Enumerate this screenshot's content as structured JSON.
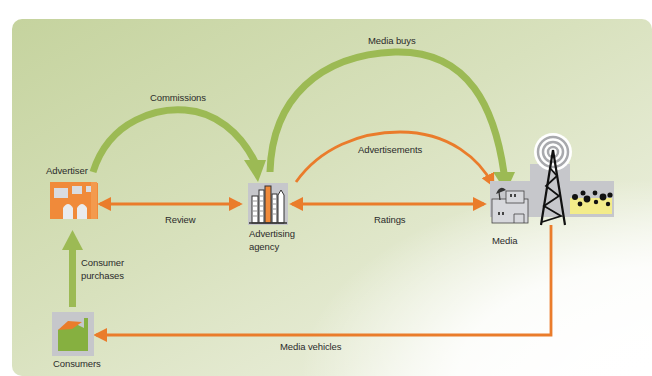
{
  "colors": {
    "panel_top": "#c9d6a4",
    "panel_mid": "#dde5c6",
    "panel_fade": "#ffffff",
    "green_arrow": "#9cba54",
    "orange_arrow": "#ea7c2b",
    "icon_bg": "#bfc0c4",
    "text": "#2b2b2b"
  },
  "nodes": {
    "advertiser": {
      "label": "Advertiser",
      "icon": "factory-icon"
    },
    "agency": {
      "label_line1": "Advertising",
      "label_line2": "agency",
      "icon": "city-buildings-icon"
    },
    "media": {
      "label": "Media",
      "icon": "broadcast-tower-icon"
    },
    "consumers": {
      "label": "Consumers",
      "icon": "house-icon"
    }
  },
  "flows": {
    "commissions": {
      "label": "Commissions",
      "from": "Advertiser",
      "to": "Advertising agency",
      "color": "green"
    },
    "media_buys": {
      "label": "Media buys",
      "from": "Advertising agency",
      "to": "Media",
      "color": "green"
    },
    "advertisements": {
      "label": "Advertisements",
      "from": "Advertising agency",
      "to": "Media",
      "color": "orange"
    },
    "review": {
      "label": "Review",
      "from": "Advertiser",
      "to": "Advertising agency",
      "color": "orange",
      "bidirectional": true
    },
    "ratings": {
      "label": "Ratings",
      "from": "Advertising agency",
      "to": "Media",
      "color": "orange",
      "bidirectional": true
    },
    "consumer_purchases": {
      "label_line1": "Consumer",
      "label_line2": "purchases",
      "from": "Consumers",
      "to": "Advertiser",
      "color": "green"
    },
    "media_vehicles": {
      "label": "Media vehicles",
      "from": "Media",
      "to": "Consumers",
      "color": "orange"
    }
  }
}
